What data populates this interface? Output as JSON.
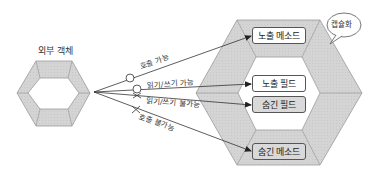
{
  "external_object": {
    "label": "외부 객체"
  },
  "encapsulation": {
    "bubble_label": "캡슐화",
    "members": [
      {
        "label": "노출 메소드",
        "kind": "exposed"
      },
      {
        "label": "노출 필드",
        "kind": "exposed"
      },
      {
        "label": "숨긴 필드",
        "kind": "hidden"
      },
      {
        "label": "숨긴 메소드",
        "kind": "hidden"
      }
    ]
  },
  "edges": [
    {
      "label": "호출 가능",
      "marker": "circle",
      "target": "노출 메소드"
    },
    {
      "label": "읽기/쓰기 가능",
      "marker": "person",
      "target": "노출 필드"
    },
    {
      "label": "읽기/쓰기 불가능",
      "marker": "cross",
      "target": "숨긴 필드"
    },
    {
      "label": "호출 불가능",
      "marker": "cross",
      "target": "숨긴 메소드"
    }
  ],
  "colors": {
    "hex_fill": "#d6d6d6",
    "hex_stroke": "#9a9a9a",
    "line": "#333333",
    "hidden_box": "#d9d9d9",
    "exposed_box": "#ffffff"
  }
}
